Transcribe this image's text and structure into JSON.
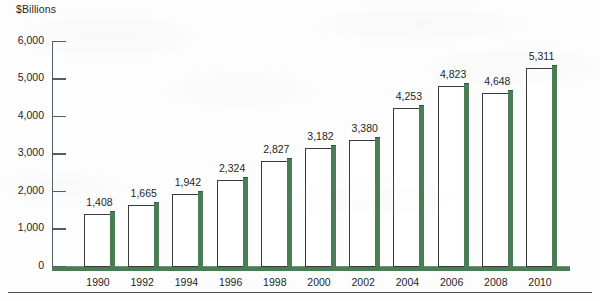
{
  "chart_data": {
    "type": "bar",
    "title": "",
    "ylabel": "$Billions",
    "xlabel": "",
    "categories": [
      "1990",
      "1992",
      "1994",
      "1996",
      "1998",
      "2000",
      "2002",
      "2004",
      "2006",
      "2008",
      "2010"
    ],
    "values": [
      1408,
      1665,
      1942,
      2324,
      2827,
      3182,
      3380,
      4253,
      4823,
      4648,
      5311
    ],
    "value_labels": [
      "1,408",
      "1,665",
      "1,942",
      "2,324",
      "2,827",
      "3,182",
      "3,380",
      "4,253",
      "4,823",
      "4,648",
      "5,311"
    ],
    "ylim": [
      0,
      6000
    ],
    "ytick_values": [
      0,
      1000,
      2000,
      3000,
      4000,
      5000,
      6000
    ],
    "ytick_labels": [
      "0",
      "1,000",
      "2,000",
      "3,000",
      "4,000",
      "5,000",
      "6,000"
    ],
    "grid": false,
    "legend": "none",
    "bar_style": "white-fill-with-green-right-shadow",
    "colors": {
      "bar_fill": "#ffffff",
      "bar_outline": "#3a3a3a",
      "bar_shadow_green": "#4a7c55",
      "axis": "#555d63",
      "text": "#1f1f1f",
      "background": "#fdfdfd"
    }
  }
}
